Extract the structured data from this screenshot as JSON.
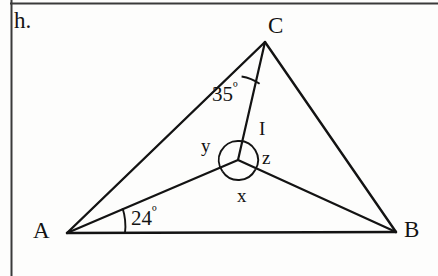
{
  "page": {
    "item_letter": "h.",
    "background_color": "#fdfdfc",
    "ink_color": "#131313"
  },
  "border": {
    "top_rule": true,
    "left_rule": true
  },
  "figure": {
    "type": "geometry-diagram",
    "vertices": [
      {
        "name": "A",
        "label": "A",
        "x": 67,
        "y": 233
      },
      {
        "name": "B",
        "label": "B",
        "x": 396,
        "y": 232
      },
      {
        "name": "C",
        "label": "C",
        "x": 265,
        "y": 42
      },
      {
        "name": "I",
        "label": "I",
        "x": 238,
        "y": 160
      }
    ],
    "segments": [
      {
        "name": "side-AB",
        "from": "A",
        "to": "B"
      },
      {
        "name": "side-AC",
        "from": "A",
        "to": "C"
      },
      {
        "name": "side-BC",
        "from": "B",
        "to": "C"
      },
      {
        "name": "cevian-AI",
        "from": "A",
        "to": "I"
      },
      {
        "name": "cevian-BI",
        "from": "B",
        "to": "I"
      },
      {
        "name": "cevian-CI",
        "from": "C",
        "to": "I"
      }
    ],
    "angle_marks": [
      {
        "name": "angle-ACI",
        "vertex": "C",
        "value": "35",
        "unit": "º",
        "label": "35º",
        "between": [
          "CA",
          "CI"
        ],
        "arc": true
      },
      {
        "name": "angle-IAB",
        "vertex": "A",
        "value": "24",
        "unit": "º",
        "label": "24º",
        "between": [
          "AB",
          "AI"
        ],
        "arc": true
      }
    ],
    "unknown_angles": [
      {
        "name": "angle-x",
        "label": "x",
        "vertex": "I",
        "between": [
          "IA",
          "IB"
        ],
        "position": "bottom",
        "arc": true
      },
      {
        "name": "angle-y",
        "label": "y",
        "vertex": "I",
        "between": [
          "IA",
          "IC"
        ],
        "position": "left",
        "arc": true
      },
      {
        "name": "angle-z",
        "label": "z",
        "vertex": "I",
        "between": [
          "IB",
          "IC"
        ],
        "position": "right",
        "arc": true
      }
    ]
  }
}
